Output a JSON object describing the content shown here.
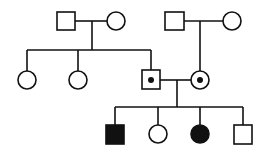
{
  "diagram": {
    "type": "pedigree",
    "colors": {
      "stroke": "#111111",
      "fill_affected": "#111111",
      "background": "#ffffff"
    },
    "generations": [
      {
        "label": "I",
        "individuals": [
          {
            "id": "I-1",
            "sex": "male",
            "status": "unaffected"
          },
          {
            "id": "I-2",
            "sex": "female",
            "status": "unaffected"
          },
          {
            "id": "I-3",
            "sex": "male",
            "status": "unaffected"
          },
          {
            "id": "I-4",
            "sex": "female",
            "status": "unaffected"
          }
        ]
      },
      {
        "label": "II",
        "individuals": [
          {
            "id": "II-1",
            "sex": "female",
            "status": "unaffected"
          },
          {
            "id": "II-2",
            "sex": "female",
            "status": "unaffected"
          },
          {
            "id": "II-3",
            "sex": "male",
            "status": "carrier"
          },
          {
            "id": "II-4",
            "sex": "female",
            "status": "carrier"
          }
        ]
      },
      {
        "label": "III",
        "individuals": [
          {
            "id": "III-1",
            "sex": "male",
            "status": "affected"
          },
          {
            "id": "III-2",
            "sex": "female",
            "status": "unaffected"
          },
          {
            "id": "III-3",
            "sex": "female",
            "status": "affected"
          },
          {
            "id": "III-4",
            "sex": "male",
            "status": "unaffected"
          }
        ]
      }
    ],
    "matings": [
      {
        "partners": [
          "I-1",
          "I-2"
        ],
        "children": [
          "II-1",
          "II-2",
          "II-3"
        ]
      },
      {
        "partners": [
          "I-3",
          "I-4"
        ],
        "children": [
          "II-4"
        ]
      },
      {
        "partners": [
          "II-3",
          "II-4"
        ],
        "children": [
          "III-1",
          "III-2",
          "III-3",
          "III-4"
        ]
      }
    ]
  }
}
